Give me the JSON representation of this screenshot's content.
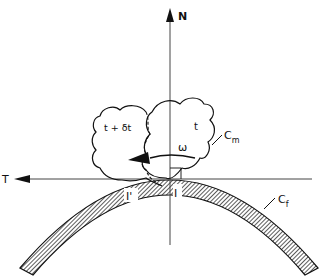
{
  "diagram": {
    "axes": {
      "normal_label": "N",
      "tangent_label": "T"
    },
    "bodies": {
      "current_label": "t",
      "next_label": "t + δt",
      "moving_body_label": "C",
      "moving_body_subscript": "m"
    },
    "surface": {
      "fixed_body_label": "C",
      "fixed_body_subscript": "f"
    },
    "points": {
      "contact_point": "I",
      "next_contact_point": "I'"
    },
    "rotation_label": "ω",
    "colors": {
      "line": "#111111",
      "hatch": "#333333",
      "background": "#ffffff"
    }
  }
}
